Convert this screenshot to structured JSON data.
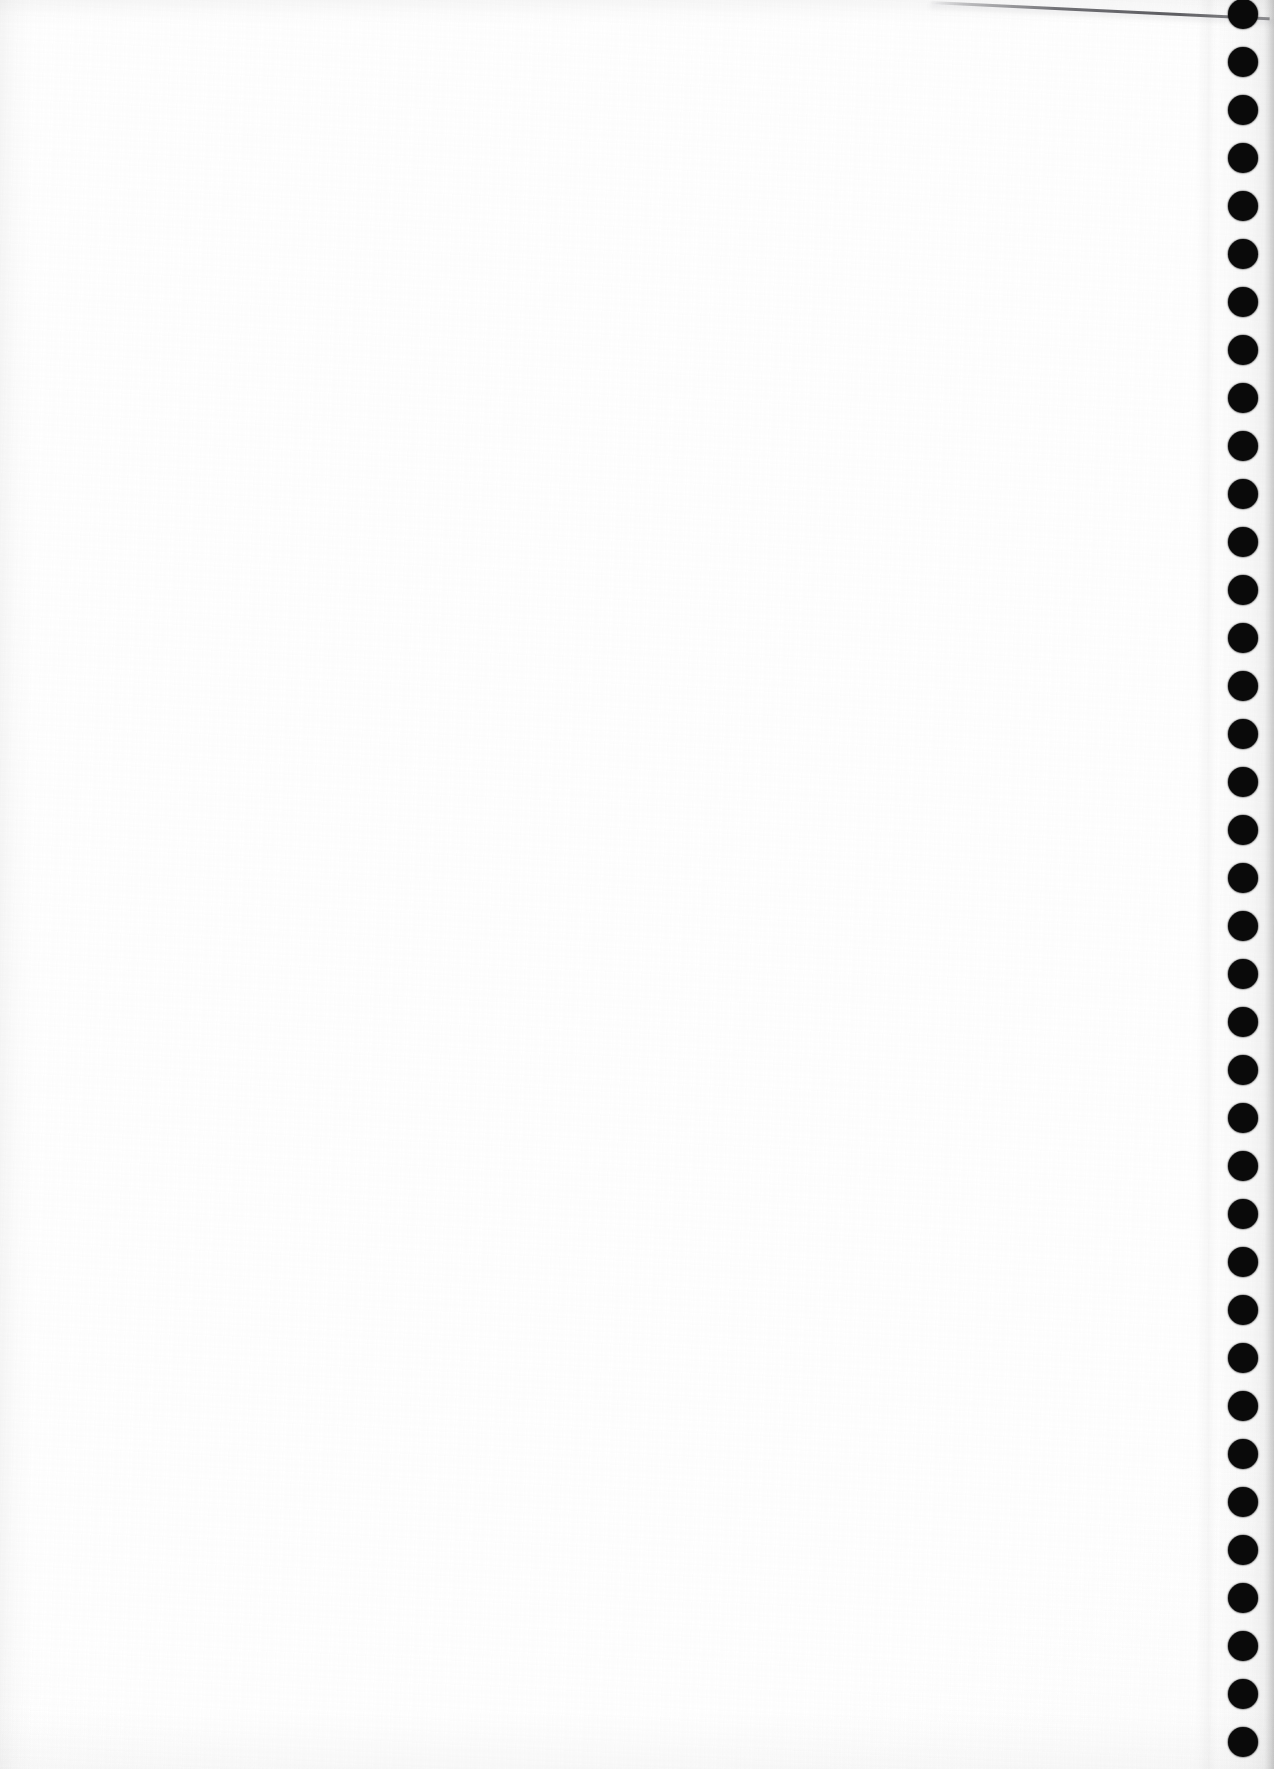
{
  "document": {
    "kind": "scanned-page",
    "title": "Scanned blank page",
    "page_width": 1274,
    "page_height": 1769,
    "orientation": "portrait",
    "visible_text": "",
    "content_note": ""
  },
  "paper": {
    "background_color": "#ffffff",
    "surface_tint": "#fdfdfd",
    "vignette_color": "#f8f8f8",
    "texture_opacity": "0.55"
  },
  "binding": {
    "edge": "right",
    "strip_label": "punched binding strip",
    "strip_width": 62,
    "hole_color": "#0a0a0a",
    "hole_diameter": 30,
    "hole_center_x": 1243,
    "first_hole_center_y": 14,
    "hole_spacing": 48,
    "hole_count": 37,
    "holes": [
      {
        "index": 1,
        "cy": 14
      },
      {
        "index": 2,
        "cy": 62
      },
      {
        "index": 3,
        "cy": 110
      },
      {
        "index": 4,
        "cy": 158
      },
      {
        "index": 5,
        "cy": 206
      },
      {
        "index": 6,
        "cy": 254
      },
      {
        "index": 7,
        "cy": 302
      },
      {
        "index": 8,
        "cy": 350
      },
      {
        "index": 9,
        "cy": 398
      },
      {
        "index": 10,
        "cy": 446
      },
      {
        "index": 11,
        "cy": 494
      },
      {
        "index": 12,
        "cy": 542
      },
      {
        "index": 13,
        "cy": 590
      },
      {
        "index": 14,
        "cy": 638
      },
      {
        "index": 15,
        "cy": 686
      },
      {
        "index": 16,
        "cy": 734
      },
      {
        "index": 17,
        "cy": 782
      },
      {
        "index": 18,
        "cy": 830
      },
      {
        "index": 19,
        "cy": 878
      },
      {
        "index": 20,
        "cy": 926
      },
      {
        "index": 21,
        "cy": 974
      },
      {
        "index": 22,
        "cy": 1022
      },
      {
        "index": 23,
        "cy": 1070
      },
      {
        "index": 24,
        "cy": 1118
      },
      {
        "index": 25,
        "cy": 1166
      },
      {
        "index": 26,
        "cy": 1214
      },
      {
        "index": 27,
        "cy": 1262
      },
      {
        "index": 28,
        "cy": 1310
      },
      {
        "index": 29,
        "cy": 1358
      },
      {
        "index": 30,
        "cy": 1406
      },
      {
        "index": 31,
        "cy": 1454
      },
      {
        "index": 32,
        "cy": 1502
      },
      {
        "index": 33,
        "cy": 1550
      },
      {
        "index": 34,
        "cy": 1598
      },
      {
        "index": 35,
        "cy": 1646
      },
      {
        "index": 36,
        "cy": 1694
      },
      {
        "index": 37,
        "cy": 1742
      }
    ]
  },
  "artifacts": {
    "edge_shadow_line": {
      "label": "underlying sheet edge shadow",
      "start_x": 930,
      "start_y": 1,
      "length": 340,
      "angle_deg": 2.75,
      "color": "#3c3c42"
    },
    "fold_crease": {
      "label": "vertical fold crease",
      "x": 1196,
      "width": 22
    },
    "left_edge_shade": {
      "label": "left margin scan shading",
      "width": 34
    },
    "top_edge_shade": {
      "label": "top margin scan shading",
      "height": 26
    },
    "bottom_edge_shade": {
      "label": "bottom margin scan shading",
      "height": 60
    }
  }
}
